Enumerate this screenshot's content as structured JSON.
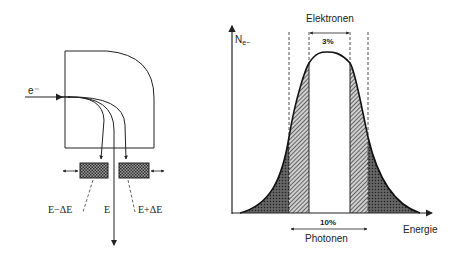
{
  "spectrometer": {
    "incoming_label": "e⁻",
    "beam_labels": {
      "low": "E−ΔE",
      "center": "E",
      "high": "E+ΔE"
    }
  },
  "distribution": {
    "y_axis_label": "N",
    "y_axis_sub": "e−",
    "x_axis_label": "Energie",
    "top_bracket_label": "Elektronen",
    "inner_width_label": "3%",
    "outer_width_label": "10%",
    "bottom_bracket_label": "Photonen"
  },
  "colors": {
    "line": "#222222",
    "dark_fill": "#555555",
    "hatch_fill": "#777777",
    "background": "#ffffff"
  }
}
